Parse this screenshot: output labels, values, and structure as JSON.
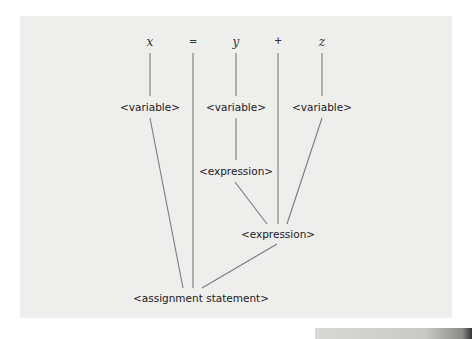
{
  "diagram": {
    "title": "",
    "terminals": [
      {
        "id": "t_x",
        "label": "x"
      },
      {
        "id": "t_eq",
        "label": "="
      },
      {
        "id": "t_y",
        "label": "y"
      },
      {
        "id": "t_plus",
        "label": "+"
      },
      {
        "id": "t_z",
        "label": "z"
      }
    ],
    "nonterminals": [
      {
        "id": "var_x",
        "label": "<variable>"
      },
      {
        "id": "var_y",
        "label": "<variable>"
      },
      {
        "id": "var_z",
        "label": "<variable>"
      },
      {
        "id": "expr_inner",
        "label": "<expression>"
      },
      {
        "id": "expr_outer",
        "label": "<expression>"
      },
      {
        "id": "assign",
        "label": "<assignment statement>"
      }
    ],
    "edges": [
      [
        "t_x",
        "var_x"
      ],
      [
        "t_y",
        "var_y"
      ],
      [
        "t_z",
        "var_z"
      ],
      [
        "var_y",
        "expr_inner"
      ],
      [
        "expr_inner",
        "expr_outer"
      ],
      [
        "t_plus",
        "expr_outer"
      ],
      [
        "var_z",
        "expr_outer"
      ],
      [
        "var_x",
        "assign"
      ],
      [
        "t_eq",
        "assign"
      ],
      [
        "expr_outer",
        "assign"
      ]
    ],
    "colors": {
      "background": "#eeeeec",
      "line": "#7a7a7a",
      "text": "#1a1a1a"
    }
  }
}
